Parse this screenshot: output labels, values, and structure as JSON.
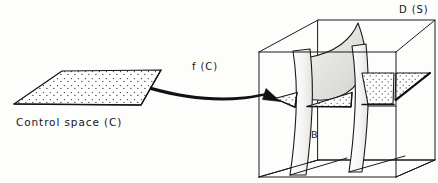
{
  "figure": {
    "kind": "line-diagram",
    "background_color": "#fdfdfb",
    "ink_color": "#16161a"
  },
  "control_space": {
    "label": "Control space (C)",
    "label_position": {
      "x": 16,
      "y": 126
    },
    "shape": "parallelogram",
    "fill": "stippled",
    "corners": [
      {
        "x": 62,
        "y": 71
      },
      {
        "x": 161,
        "y": 70
      },
      {
        "x": 141,
        "y": 105
      },
      {
        "x": 14,
        "y": 104
      }
    ]
  },
  "mapping_arrow": {
    "label": "f (C)",
    "label_position": {
      "x": 192,
      "y": 70
    },
    "from": {
      "x": 151,
      "y": 88
    },
    "to": {
      "x": 277,
      "y": 99
    },
    "style": "curved-tapered-arrow",
    "head": "solid-triangle"
  },
  "behaviour_space": {
    "label": "D (S)",
    "label_position": {
      "x": 399,
      "y": 13
    },
    "inner_label": "B",
    "inner_label_position": {
      "x": 311,
      "y": 138
    },
    "shape": "wireframe-cube",
    "cube_vertices": {
      "front_bottom_left": {
        "x": 259,
        "y": 177
      },
      "front_bottom_right": {
        "x": 396,
        "y": 177
      },
      "front_top_right": {
        "x": 396,
        "y": 52
      },
      "front_top_left": {
        "x": 259,
        "y": 52
      },
      "back_bottom_left": {
        "x": 318,
        "y": 160
      },
      "back_bottom_right": {
        "x": 435,
        "y": 160
      },
      "back_top_right": {
        "x": 435,
        "y": 20
      },
      "back_top_left": {
        "x": 318,
        "y": 20
      }
    },
    "contents": [
      {
        "name": "fold-sheet-left",
        "type": "curved-vertical-sheet"
      },
      {
        "name": "fold-sheet-right",
        "type": "curved-vertical-sheet"
      },
      {
        "name": "cusp-surface",
        "type": "shaded-curved-surface"
      },
      {
        "name": "wedge-1",
        "type": "stippled-triangular-wedge"
      },
      {
        "name": "wedge-2",
        "type": "stippled-triangular-wedge"
      },
      {
        "name": "wedge-3",
        "type": "stippled-triangular-wedge"
      },
      {
        "name": "wedge-4",
        "type": "stippled-triangular-wedge"
      }
    ]
  }
}
